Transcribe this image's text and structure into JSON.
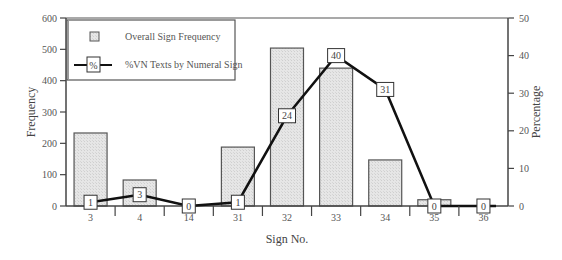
{
  "chart_data": {
    "type": "bar+line",
    "title": "",
    "xlabel": "Sign No.",
    "ylabel": "Frequency",
    "y2label": "Percentage",
    "categories": [
      "3",
      "4",
      "14",
      "31",
      "32",
      "33",
      "34",
      "35",
      "36"
    ],
    "ylim": [
      0,
      600
    ],
    "y2lim": [
      0,
      50
    ],
    "yticks": [
      0,
      100,
      200,
      300,
      400,
      500,
      600
    ],
    "y2ticks": [
      0,
      10,
      20,
      30,
      40,
      50
    ],
    "grid": false,
    "legend_position": "upper-left",
    "series": [
      {
        "name": "Overall Sign Frequency",
        "type": "bar",
        "axis": "left",
        "values": [
          233,
          83,
          0,
          188,
          504,
          440,
          147,
          20,
          0
        ],
        "color": "#e4e4e4"
      },
      {
        "name": "%VN Texts by Numeral Sign",
        "type": "line",
        "axis": "right",
        "values": [
          1,
          3,
          0,
          1,
          24,
          40,
          31,
          0,
          0
        ],
        "labels": [
          "1",
          "3",
          "0",
          "1",
          "24",
          "40",
          "31",
          "0",
          "0"
        ],
        "color": "#111111",
        "marker": "labeled-box"
      }
    ]
  },
  "legend": {
    "bar_label": "Overall Sign Frequency",
    "line_label": "%VN Texts by Numeral Sign",
    "line_marker_text": "%"
  },
  "axes": {
    "x_title": "Sign No.",
    "y_title": "Frequency",
    "y2_title": "Percentage"
  }
}
